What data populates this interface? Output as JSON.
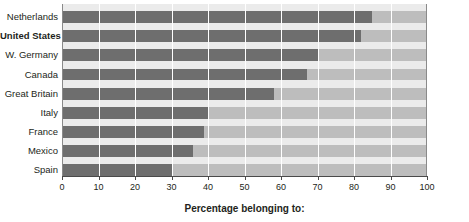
{
  "chart_data": {
    "type": "bar",
    "orientation": "horizontal",
    "title": "",
    "xlabel": "Percentage belonging to:",
    "ylabel": "",
    "xlim": [
      0,
      100
    ],
    "xticks": [
      0,
      10,
      20,
      30,
      40,
      50,
      60,
      70,
      80,
      90,
      100
    ],
    "grid": true,
    "legend": "none",
    "categories": [
      "Netherlands",
      "United States",
      "W. Germany",
      "Canada",
      "Great Britain",
      "Italy",
      "France",
      "Mexico",
      "Spain"
    ],
    "values": [
      85,
      82,
      70,
      67,
      58,
      40,
      39,
      36,
      30
    ],
    "highlighted_category": "United States",
    "colors": {
      "bar_fill": "#6e6e6e",
      "bar_track": "#bdbdbd",
      "row_gap": "#ebebeb",
      "axis": "#4a4a4a",
      "text": "#231f20",
      "background": "#ffffff"
    }
  }
}
